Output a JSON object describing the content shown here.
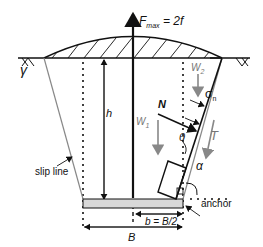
{
  "labels": {
    "force": "F",
    "force_sub": "max",
    "force_eq": " = 2f",
    "gamma": "γ",
    "h": "h",
    "N": "N",
    "W1": "W",
    "W1_sub": "1",
    "W2": "W",
    "W2_sub": "2",
    "sigma_n": "σ",
    "sigma_sub": "n",
    "theta": "θ",
    "T": "T",
    "alpha": "α",
    "slip_line": "slip line",
    "anchor": "anchor",
    "b_eq": "b = B/2",
    "B": "B"
  },
  "colors": {
    "line": "#111111",
    "gray_line": "#888888",
    "anchor_fill": "#d8d8d8"
  }
}
